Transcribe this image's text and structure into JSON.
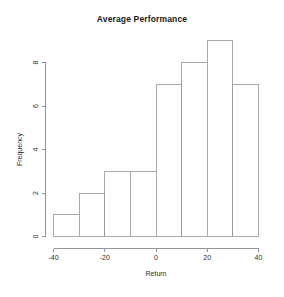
{
  "chart_data": {
    "type": "bar",
    "subtype": "histogram",
    "title": "Average Performance",
    "xlabel": "Return",
    "ylabel": "Frequency",
    "categories": [
      "-40 to -30",
      "-30 to -20",
      "-20 to -10",
      "-10 to 0",
      "0 to 10",
      "10 to 20",
      "20 to 30",
      "30 to 40"
    ],
    "bin_edges": [
      -40,
      -30,
      -20,
      -10,
      0,
      10,
      20,
      30,
      40
    ],
    "bin_width": 10,
    "values": [
      1,
      2,
      3,
      3,
      7,
      8,
      9,
      7
    ],
    "x_ticks": [
      -40,
      -20,
      0,
      20,
      40
    ],
    "x_tick_labels": [
      "-40",
      "-20",
      "0",
      "20",
      "40"
    ],
    "y_ticks": [
      0,
      2,
      4,
      6,
      8
    ],
    "y_tick_labels": [
      "0",
      "2",
      "4",
      "6",
      "8"
    ],
    "xlim": [
      -40,
      40
    ],
    "ylim": [
      0,
      9
    ],
    "grid": false,
    "legend": null,
    "bar_fill_color": "#ffffff",
    "bar_border_color": "#9a9a9a",
    "axis_color": "#8a8a8a",
    "background_color": "#ffffff"
  }
}
